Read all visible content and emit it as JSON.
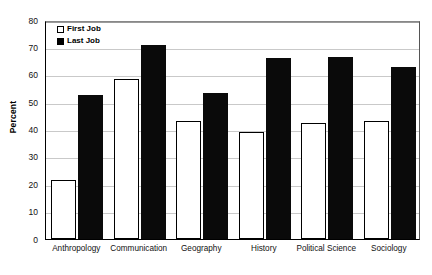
{
  "chart_data": {
    "type": "bar",
    "title": "",
    "xlabel": "",
    "ylabel": "Percent",
    "ylim": [
      0,
      80
    ],
    "ytick_step": 10,
    "yticks": [
      80,
      70,
      60,
      50,
      40,
      30,
      20,
      10,
      0
    ],
    "grid": true,
    "legend_position": "top-left-inside",
    "categories": [
      "Anthropology",
      "Communication",
      "Geography",
      "History",
      "Political Science",
      "Sociology"
    ],
    "series": [
      {
        "name": "First Job",
        "color": "#ffffff",
        "edge_color": "#000000",
        "values": [
          21.5,
          58.5,
          43,
          39,
          42.5,
          43
        ]
      },
      {
        "name": "Last Job",
        "color": "#0a0a0a",
        "edge_color": "#000000",
        "values": [
          52.5,
          71,
          53.5,
          66,
          66.5,
          63
        ]
      }
    ]
  },
  "axis": {
    "y_title": "Percent"
  },
  "legend": {
    "items": [
      {
        "label": "First Job",
        "swatch": "hollow-square-icon"
      },
      {
        "label": "Last Job",
        "swatch": "filled-square-icon"
      }
    ]
  },
  "colors": {
    "bar_first": "#ffffff",
    "bar_last": "#0a0a0a",
    "gridline": "#c9c9c9",
    "axis": "#000000",
    "background": "#ffffff"
  }
}
